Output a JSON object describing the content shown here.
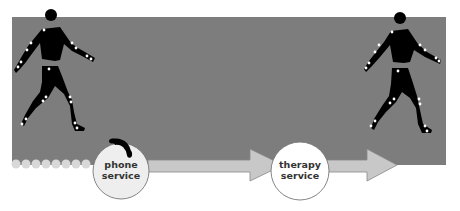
{
  "diagram": {
    "nodes": [
      {
        "id": "phone",
        "label_line1": "phone",
        "label_line2": "service",
        "icon": "telephone-handset-icon"
      },
      {
        "id": "therapy",
        "label_line1": "therapy",
        "label_line2": "service"
      }
    ],
    "figures": [
      {
        "id": "walker-left",
        "type": "motion-capture-figure"
      },
      {
        "id": "walker-right",
        "type": "motion-capture-figure"
      }
    ],
    "colors": {
      "background_panel": "#7d7d7d",
      "arrow_fill": "#c8c8c8",
      "circle_fill": "#eeeeee",
      "figure": "#000000"
    }
  }
}
